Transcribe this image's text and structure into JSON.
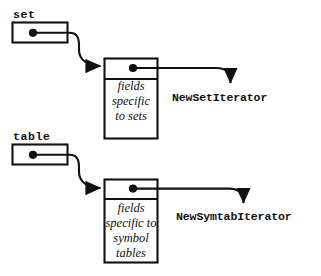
{
  "diagram": {
    "type": "pointer-object-diagram",
    "background_color": "#ffffff",
    "stroke_color": "#111111",
    "variables": [
      {
        "name": "set-variable",
        "label": "set",
        "x": 12,
        "y": 22,
        "w": 56,
        "h": 21,
        "dot_x": 33,
        "dot_y": 33
      },
      {
        "name": "table-variable",
        "label": "table",
        "x": 12,
        "y": 144,
        "w": 56,
        "h": 21,
        "dot_x": 33,
        "dot_y": 155
      }
    ],
    "objects": [
      {
        "name": "set-object",
        "x": 104,
        "y": 58,
        "w": 54,
        "h": 81,
        "header_height": 21,
        "dot_x": 133,
        "dot_y": 68,
        "fields_text": "fields\nspecific\nto sets"
      },
      {
        "name": "symtab-object",
        "x": 104,
        "y": 179,
        "w": 54,
        "h": 84,
        "header_height": 20,
        "dot_x": 133,
        "dot_y": 189,
        "fields_text": "fields\nspecific to\nsymbol\ntables"
      }
    ],
    "iterator_labels": [
      {
        "name": "new-set-iterator-label",
        "label": "NewSetIterator"
      },
      {
        "name": "new-symtab-iterator-label",
        "label": "NewSymtabIterator"
      }
    ],
    "fields_labels": {
      "set_line1": "fields",
      "set_line2": "specific",
      "set_line3": "to sets",
      "symtab_line1": "fields",
      "symtab_line2": "specific to",
      "symtab_line3": "symbol",
      "symtab_line4": "tables"
    }
  }
}
